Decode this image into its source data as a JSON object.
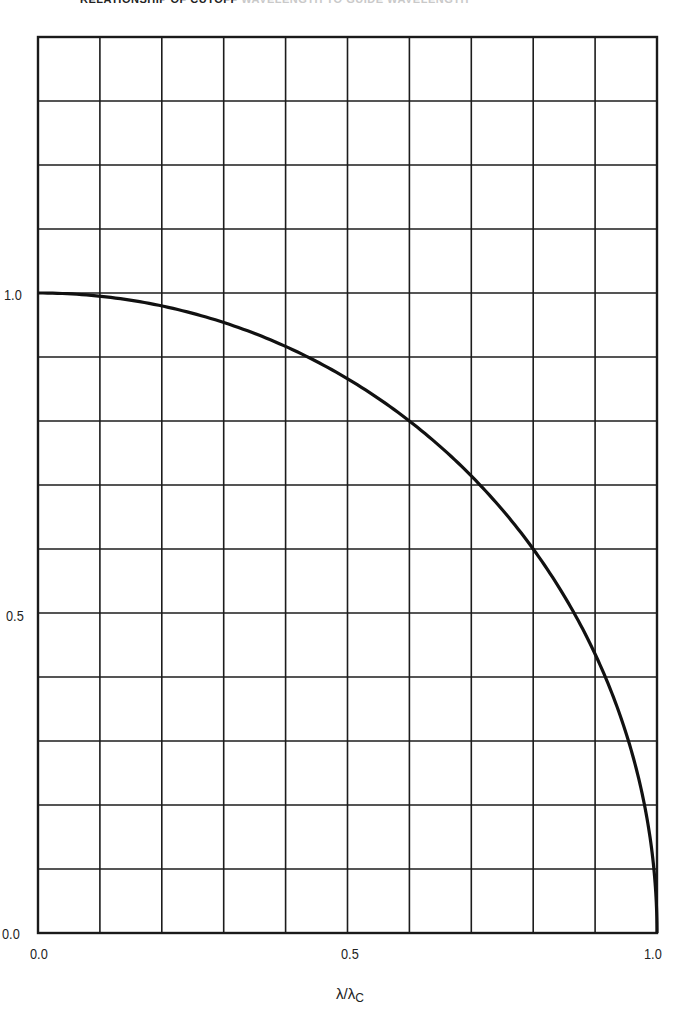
{
  "title": {
    "visible": "RELATIONSHIP OF CUTOFF",
    "faded": "WAVELENGTH TO GUIDE WAVELENGTH"
  },
  "axes": {
    "x_label_main": "λ/λ",
    "x_label_sub": "C",
    "x_ticks": [
      "0.0",
      "0.5",
      "1.0"
    ],
    "y_ticks": [
      "0.0",
      "0.5",
      "1.0"
    ]
  },
  "chart_data": {
    "type": "line",
    "xlabel": "λ/λc",
    "ylabel": "",
    "xlim": [
      0.0,
      1.0
    ],
    "ylim": [
      0.0,
      1.4
    ],
    "grid": true,
    "grid_x_step": 0.1,
    "grid_y_step": 0.1,
    "x_tick_labels": [
      "0.0",
      "0.5",
      "1.0"
    ],
    "y_tick_labels": [
      "0.0",
      "0.5",
      "1.0"
    ],
    "series": [
      {
        "name": "sqrt(1 - (λ/λc)^2)",
        "x": [
          0.0,
          0.1,
          0.2,
          0.3,
          0.4,
          0.5,
          0.6,
          0.7,
          0.8,
          0.9,
          0.95,
          0.98,
          1.0
        ],
        "y": [
          1.0,
          0.995,
          0.98,
          0.954,
          0.917,
          0.866,
          0.8,
          0.714,
          0.6,
          0.436,
          0.312,
          0.199,
          0.0
        ]
      }
    ],
    "legend": "none"
  }
}
